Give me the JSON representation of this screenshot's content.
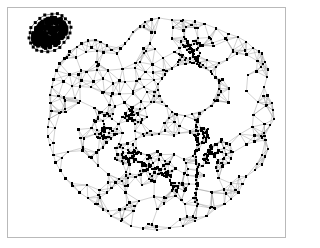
{
  "figure": {
    "title": "",
    "caption": "",
    "background_color": "#ffffff",
    "frame_color": "#b9b9b9",
    "node_color": "#000000",
    "edge_color": "#9a9a9a",
    "node_size_px": 2.4,
    "edge_width_px": 0.45
  },
  "chart_data": {
    "type": "scatter",
    "title": "",
    "subtitle": "",
    "xlabel": "",
    "ylabel": "",
    "xlim": [
      0,
      279
    ],
    "ylim": [
      0,
      231
    ],
    "grid": false,
    "legend": null,
    "tick_labels": {
      "x": [],
      "y": []
    },
    "annotations": [],
    "components": [
      {
        "name": "island-cluster",
        "role": "dense disconnected component",
        "approx_center": [
          42,
          25
        ],
        "approx_radius": 19,
        "node_count": 60,
        "fill": "solid-black-blob"
      },
      {
        "name": "main-component",
        "role": "large triangulated mesh with interior void",
        "node_count": 620,
        "void": {
          "approx_center": [
            182,
            82
          ],
          "approx_radius": 26
        }
      }
    ],
    "series": [
      {
        "name": "vertices",
        "marker": "square",
        "color": "#000000",
        "count": 680
      },
      {
        "name": "edges",
        "color": "#9a9a9a",
        "count": 1900
      }
    ]
  },
  "structure": {
    "island": {
      "center_x": 42,
      "center_y": 25,
      "rx": 19,
      "ry": 14,
      "rotation_deg": -35,
      "core_points": 420,
      "rim_points": 22
    },
    "main": {
      "hull": [
        [
          152,
          10
        ],
        [
          176,
          12
        ],
        [
          198,
          16
        ],
        [
          222,
          26
        ],
        [
          240,
          34
        ],
        [
          256,
          46
        ],
        [
          262,
          62
        ],
        [
          258,
          80
        ],
        [
          266,
          96
        ],
        [
          268,
          112
        ],
        [
          258,
          126
        ],
        [
          262,
          142
        ],
        [
          256,
          158
        ],
        [
          240,
          170
        ],
        [
          232,
          186
        ],
        [
          218,
          198
        ],
        [
          200,
          210
        ],
        [
          176,
          220
        ],
        [
          150,
          224
        ],
        [
          124,
          220
        ],
        [
          104,
          210
        ],
        [
          88,
          198
        ],
        [
          72,
          186
        ],
        [
          58,
          172
        ],
        [
          48,
          156
        ],
        [
          42,
          138
        ],
        [
          40,
          120
        ],
        [
          44,
          104
        ],
        [
          42,
          88
        ],
        [
          46,
          72
        ],
        [
          52,
          56
        ],
        [
          62,
          44
        ],
        [
          74,
          36
        ],
        [
          88,
          32
        ],
        [
          100,
          38
        ],
        [
          110,
          46
        ],
        [
          118,
          36
        ],
        [
          126,
          24
        ],
        [
          138,
          14
        ]
      ],
      "void": {
        "cx": 182,
        "cy": 82,
        "rx": 28,
        "ry": 24
      },
      "clusters": [
        {
          "cx": 98,
          "cy": 118,
          "r": 16,
          "n": 42
        },
        {
          "cx": 118,
          "cy": 148,
          "r": 14,
          "n": 34
        },
        {
          "cx": 150,
          "cy": 160,
          "r": 18,
          "n": 40
        },
        {
          "cx": 212,
          "cy": 148,
          "r": 16,
          "n": 44
        },
        {
          "cx": 186,
          "cy": 44,
          "r": 14,
          "n": 36
        },
        {
          "cx": 196,
          "cy": 128,
          "r": 9,
          "n": 26
        },
        {
          "cx": 128,
          "cy": 108,
          "r": 10,
          "n": 22
        },
        {
          "cx": 172,
          "cy": 180,
          "r": 9,
          "n": 18
        }
      ],
      "ridges": [
        {
          "x1": 190,
          "y1": 112,
          "x2": 190,
          "y2": 200,
          "n": 40,
          "jitter": 2.0
        },
        {
          "x1": 120,
          "y1": 150,
          "x2": 164,
          "y2": 170,
          "n": 26,
          "jitter": 2.2
        },
        {
          "x1": 178,
          "y1": 30,
          "x2": 196,
          "y2": 66,
          "n": 22,
          "jitter": 2.2
        }
      ],
      "scatter_points": 300
    }
  }
}
